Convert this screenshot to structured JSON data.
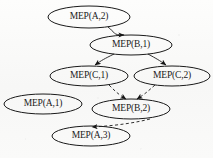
{
  "figure": {
    "caption": "",
    "width": 213,
    "height": 158,
    "background_color": "#fbfbfa",
    "stroke_color": "#1a1a1a"
  },
  "graph_data": {
    "type": "diagram",
    "diagram_kind": "directed-graph",
    "node_shape": "ellipse",
    "nodes": [
      {
        "id": "A2",
        "label": "MEP(A,2)",
        "cx": 89,
        "cy": 17,
        "rx": 41,
        "ry": 11
      },
      {
        "id": "B1",
        "label": "MEP(B,1)",
        "cx": 131,
        "cy": 45,
        "rx": 41,
        "ry": 10
      },
      {
        "id": "C1",
        "label": "MEP(C,1)",
        "cx": 89,
        "cy": 76,
        "rx": 39,
        "ry": 10
      },
      {
        "id": "C2",
        "label": "MEP(C,2)",
        "cx": 172,
        "cy": 76,
        "rx": 38,
        "ry": 10
      },
      {
        "id": "A1",
        "label": "MEP(A,1)",
        "cx": 43,
        "cy": 104,
        "rx": 39,
        "ry": 10
      },
      {
        "id": "B2",
        "label": "MEP(B,2)",
        "cx": 131,
        "cy": 109,
        "rx": 39,
        "ry": 10
      },
      {
        "id": "A3",
        "label": "MEP(A,3)",
        "cx": 91,
        "cy": 136,
        "rx": 39,
        "ry": 10
      }
    ],
    "edges": [
      {
        "from": "A2",
        "to": "B1",
        "style": "solid",
        "arrow": true
      },
      {
        "from": "B1",
        "to": "C1",
        "style": "solid",
        "arrow": true
      },
      {
        "from": "B1",
        "to": "C2",
        "style": "solid",
        "arrow": true
      },
      {
        "from": "C1",
        "to": "B2",
        "style": "dashed",
        "arrow": true
      },
      {
        "from": "C2",
        "to": "B2",
        "style": "dashed",
        "arrow": true
      },
      {
        "from": "B2",
        "to": "A3",
        "style": "dashed",
        "arrow": true
      }
    ],
    "isolated_nodes": [
      "A1"
    ],
    "legend": []
  }
}
